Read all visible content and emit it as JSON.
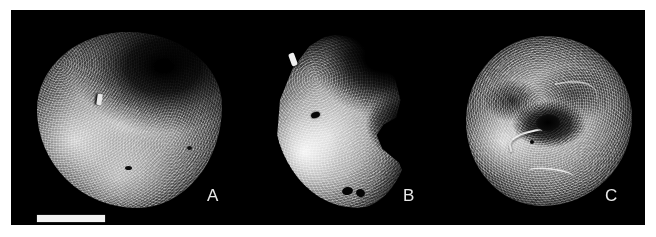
{
  "figure": {
    "kind": "micrograph-plate",
    "background_color": "#ffffff",
    "panel_color": "#000000",
    "specimens": [
      {
        "label": "A",
        "description": "rounded ovoid granular specimen with dark upper-right surface and bright lower-left illumination",
        "label_color": "#e8e8e8"
      },
      {
        "label": "B",
        "description": "narrow elongate specimen with a lateral notch on the right margin and small dark pores",
        "label_color": "#e8e8e8"
      },
      {
        "label": "C",
        "description": "sub-spherical specimen with bright ridge structures and a central dark depression",
        "label_color": "#e8e8e8"
      }
    ],
    "scale_bar": {
      "name": "scale-bar",
      "color": "#f2f2f2",
      "caption": ""
    }
  }
}
